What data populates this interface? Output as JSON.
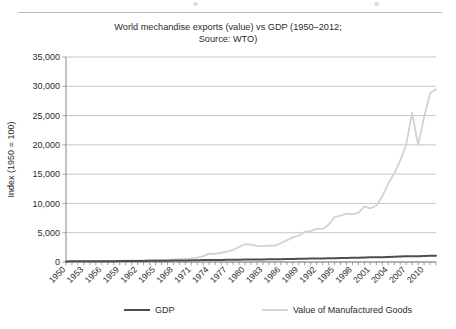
{
  "figure": {
    "title_line1": "World mechandise exports (value) vs GDP (1950–2012;",
    "title_line2": "Source: WTO)",
    "background_color": "#ffffff",
    "rule_color": "#b8b8b8"
  },
  "chart_data": {
    "type": "line",
    "title": "World mechandise exports (value) vs GDP (1950–2012; Source: WTO)",
    "xlabel": "",
    "ylabel": "Index (1950 = 100)",
    "xlim": [
      1950,
      2012
    ],
    "ylim": [
      0,
      35000
    ],
    "grid": true,
    "grid_axis": "y",
    "legend_position": "bottom",
    "ytick_labels": [
      "0",
      "5,000",
      "10,000",
      "15,000",
      "20,000",
      "25,000",
      "30,000",
      "35,000"
    ],
    "ytick_values": [
      0,
      5000,
      10000,
      15000,
      20000,
      25000,
      30000,
      35000
    ],
    "xtick_labels": [
      "1950",
      "1953",
      "1956",
      "1959",
      "1962",
      "1965",
      "1968",
      "1971",
      "1974",
      "1977",
      "1980",
      "1983",
      "1986",
      "1989",
      "1992",
      "1995",
      "1998",
      "2001",
      "2004",
      "2007",
      "2010"
    ],
    "xtick_values": [
      1950,
      1953,
      1956,
      1959,
      1962,
      1965,
      1968,
      1971,
      1974,
      1977,
      1980,
      1983,
      1986,
      1989,
      1992,
      1995,
      1998,
      2001,
      2004,
      2007,
      2010
    ],
    "x": [
      1950,
      1951,
      1952,
      1953,
      1954,
      1955,
      1956,
      1957,
      1958,
      1959,
      1960,
      1961,
      1962,
      1963,
      1964,
      1965,
      1966,
      1967,
      1968,
      1969,
      1970,
      1971,
      1972,
      1973,
      1974,
      1975,
      1976,
      1977,
      1978,
      1979,
      1980,
      1981,
      1982,
      1983,
      1984,
      1985,
      1986,
      1987,
      1988,
      1989,
      1990,
      1991,
      1992,
      1993,
      1994,
      1995,
      1996,
      1997,
      1998,
      1999,
      2000,
      2001,
      2002,
      2003,
      2004,
      2005,
      2006,
      2007,
      2008,
      2009,
      2010,
      2011,
      2012
    ],
    "series": [
      {
        "name": "GDP",
        "color": "#4d4d4d",
        "width": 2.0,
        "values": [
          100,
          108,
          113,
          119,
          124,
          132,
          139,
          145,
          148,
          156,
          164,
          171,
          180,
          189,
          201,
          213,
          225,
          234,
          248,
          263,
          275,
          288,
          303,
          322,
          332,
          337,
          355,
          369,
          386,
          402,
          410,
          418,
          420,
          432,
          452,
          472,
          487,
          505,
          530,
          552,
          570,
          578,
          590,
          602,
          626,
          648,
          672,
          700,
          718,
          742,
          774,
          790,
          806,
          828,
          868,
          902,
          940,
          982,
          1000,
          980,
          1025,
          1060,
          1085
        ]
      },
      {
        "name": "Value of Manufactured Goods",
        "color": "#d2d2d2",
        "width": 1.8,
        "values": [
          100,
          130,
          128,
          133,
          142,
          158,
          175,
          188,
          182,
          196,
          219,
          231,
          246,
          270,
          305,
          335,
          368,
          385,
          430,
          490,
          560,
          625,
          740,
          1010,
          1430,
          1395,
          1580,
          1790,
          2070,
          2580,
          3030,
          2950,
          2760,
          2720,
          2800,
          2810,
          3200,
          3700,
          4200,
          4500,
          5150,
          5250,
          5700,
          5640,
          6350,
          7640,
          7930,
          8250,
          8130,
          8400,
          9500,
          9150,
          9600,
          11200,
          13400,
          15100,
          17300,
          20000,
          25500,
          20000,
          24700,
          28800,
          29500
        ]
      }
    ]
  },
  "legend": {
    "items": [
      {
        "label": "GDP",
        "color": "#4d4d4d"
      },
      {
        "label": "Value of Manufactured Goods",
        "color": "#d2d2d2"
      }
    ]
  }
}
